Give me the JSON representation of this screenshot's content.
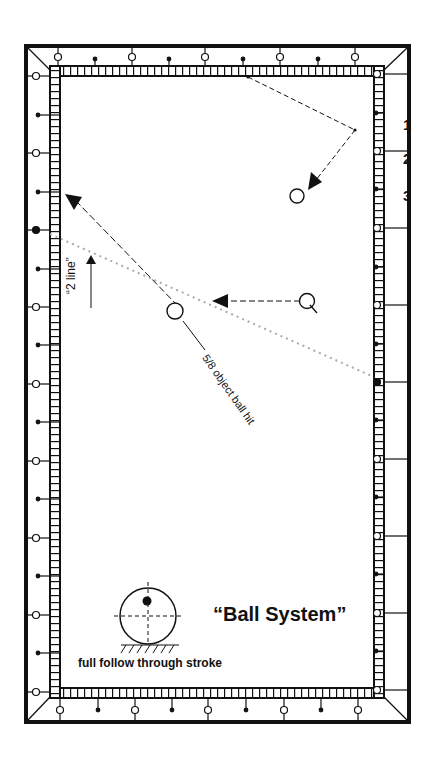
{
  "diagram": {
    "title": "“Ball System”",
    "stroke_caption": "full follow through stroke",
    "two_line_label": "“2 line”",
    "hit_label": "5/8 object ball hit",
    "diamond_numbers": [
      "1",
      "2",
      "3"
    ],
    "colors": {
      "ink": "#111111",
      "dotted_line": "#aaaaaa",
      "background": "#ffffff"
    }
  }
}
